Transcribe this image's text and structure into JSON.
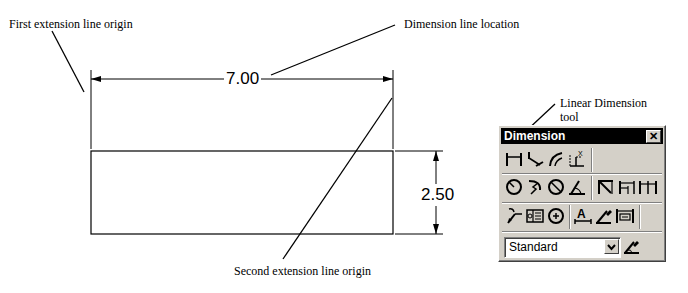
{
  "annotations": {
    "first_extension_line_origin": "First extension line origin",
    "dimension_line_location": "Dimension line location",
    "second_extension_line_origin": "Second extension line origin",
    "linear_dimension_tool_line1": "Linear Dimension",
    "linear_dimension_tool_line2": "tool"
  },
  "drawing": {
    "horizontal_dimension": "7.00",
    "vertical_dimension": "2.50"
  },
  "toolbar": {
    "title": "Dimension",
    "close_label": "✕",
    "rows": [
      [
        "linear",
        "aligned",
        "arc-length",
        "ordinate"
      ],
      [
        "radius",
        "jogged",
        "diameter",
        "angular",
        "quick-dimension",
        "baseline",
        "continue"
      ],
      [
        "quick-leader",
        "tolerance",
        "center-mark",
        "dimension-edit",
        "dimension-text-edit",
        "dimension-update"
      ]
    ],
    "style_select": {
      "value": "Standard"
    },
    "style_button": "dimension-style"
  }
}
